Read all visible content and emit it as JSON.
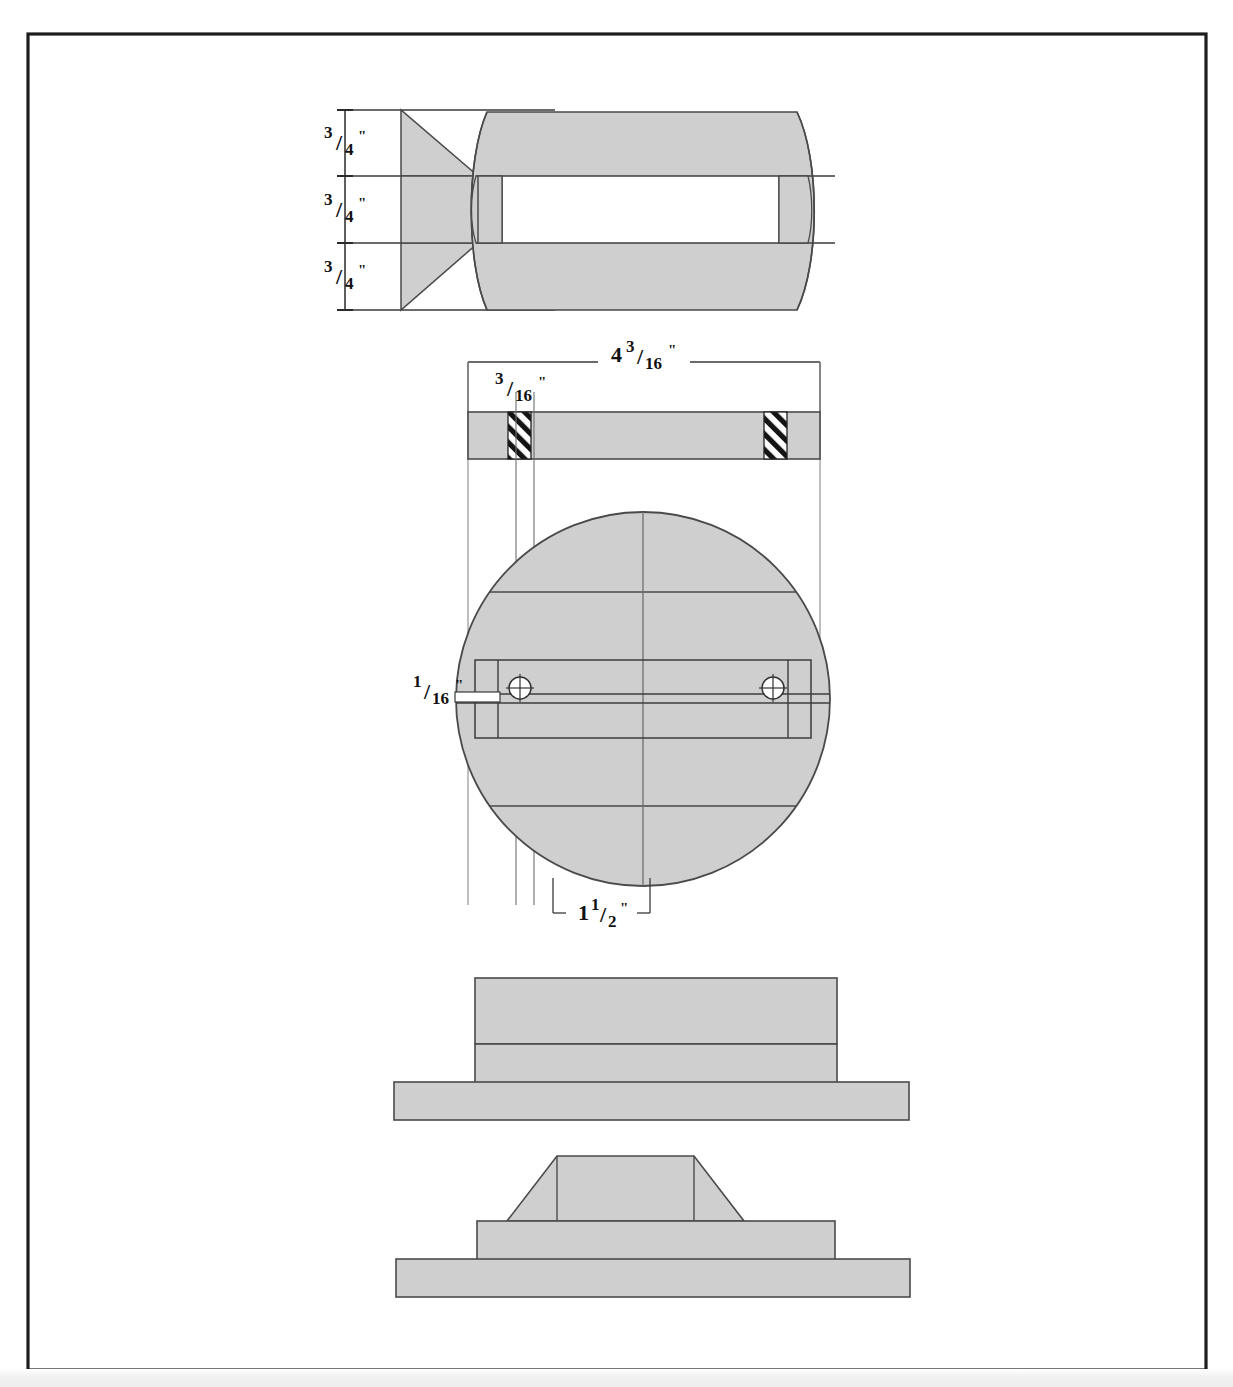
{
  "sheet": {
    "title": "Mechanical part orthographic drawing",
    "border_color": "#1a1a1a",
    "background_color": "#ffffff",
    "fill_color": "#cfcfcf",
    "line_color": "#4a4a4a",
    "dark_line_color": "#222222",
    "width": 1233,
    "height": 1387
  },
  "views": [
    {
      "id": "view-section-top",
      "name": "sectional-side-view",
      "description": "Sectioned side elevation showing conical funnel joined to a barrel body with a central bore"
    },
    {
      "id": "view-plan-circle",
      "name": "plan-view",
      "description": "Plan view: circular disc with a rectangular slot band and two crosshair pin holes"
    },
    {
      "id": "view-step-block",
      "name": "stepped-block-elevation",
      "description": "Front elevation of a stepped rectangular block on a base plate"
    },
    {
      "id": "view-pyramid-base",
      "name": "trapezoid-on-base-elevation",
      "description": "Front elevation of a trapezoidal boss on a two-tier stepped base"
    }
  ],
  "dimensions": {
    "top_view": [
      {
        "id": "dim-top-1",
        "whole": "",
        "numerator": "3",
        "denominator": "4",
        "unit": "\"",
        "label": "3/4\""
      },
      {
        "id": "dim-top-2",
        "whole": "",
        "numerator": "3",
        "denominator": "4",
        "unit": "\"",
        "label": "3/4\""
      },
      {
        "id": "dim-top-3",
        "whole": "",
        "numerator": "3",
        "denominator": "4",
        "unit": "\"",
        "label": "3/4\""
      }
    ],
    "plan_view": [
      {
        "id": "dim-overall-width",
        "whole": "4",
        "numerator": "3",
        "denominator": "16",
        "unit": "\"",
        "label": "4 3/16\""
      },
      {
        "id": "dim-slot-width",
        "whole": "",
        "numerator": "3",
        "denominator": "16",
        "unit": "\"",
        "label": "3/16\""
      },
      {
        "id": "dim-hole-size",
        "whole": "",
        "numerator": "1",
        "denominator": "16",
        "unit": "\"",
        "label": "1/16\""
      },
      {
        "id": "dim-hole-offset",
        "whole": "1",
        "numerator": "1",
        "denominator": "2",
        "unit": "\"",
        "label": "1 1/2\""
      }
    ]
  },
  "features": {
    "pin_holes": 2,
    "hatch_blocks": 2,
    "hatch_name": "section-hatch"
  }
}
